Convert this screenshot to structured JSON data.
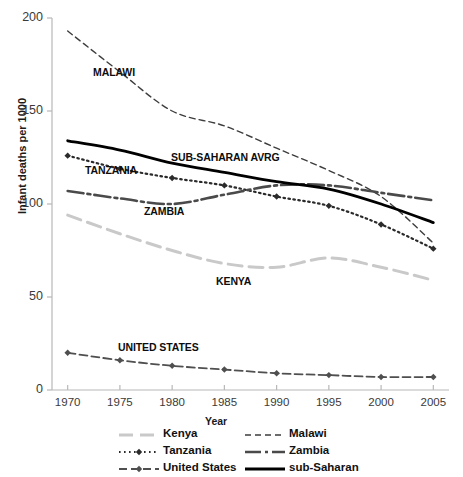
{
  "chart_data": {
    "type": "line",
    "title": "",
    "xlabel": "Year",
    "ylabel": "Infant deaths per 1000",
    "x": [
      1970,
      1975,
      1980,
      1985,
      1990,
      1995,
      2000,
      2005
    ],
    "xlim": [
      1968.5,
      2006.5
    ],
    "ylim": [
      0,
      200
    ],
    "yticks": [
      0,
      50,
      100,
      150,
      200
    ],
    "xticks": [
      "1970",
      "1975",
      "1980",
      "1985",
      "1990",
      "1995",
      "2000",
      "2005"
    ],
    "grid": false,
    "legend_position": "bottom",
    "series": [
      {
        "name": "Kenya",
        "legend_label": "Kenya",
        "annotation": "KENYA",
        "color": "#c9c9c9",
        "dash": "14,7",
        "width": 3,
        "marker": "none",
        "values": [
          94,
          84,
          75,
          68,
          66,
          71,
          66,
          59
        ]
      },
      {
        "name": "Malawi",
        "legend_label": "Malawi",
        "annotation": "MALAWI",
        "color": "#3d3d3d",
        "dash": "6,4",
        "width": 1.4,
        "marker": "none",
        "values": [
          193,
          171,
          150,
          142,
          130,
          118,
          104,
          79
        ]
      },
      {
        "name": "Tanzania",
        "legend_label": "Tanzania",
        "annotation": "TANZANIA",
        "color": "#2b2b2b",
        "dash": "1.6,3.4",
        "width": 2.2,
        "marker": "diamond",
        "values": [
          126,
          119,
          114,
          110,
          104,
          99,
          89,
          76
        ]
      },
      {
        "name": "Zambia",
        "legend_label": "Zambia",
        "annotation": "ZAMBIA",
        "color": "#4a4a4a",
        "dash": "16,4,3,4",
        "width": 2.6,
        "marker": "none",
        "values": [
          107,
          103,
          100,
          105,
          110,
          110,
          106,
          102
        ]
      },
      {
        "name": "United States",
        "legend_label": "United States",
        "annotation": "UNITED STATES",
        "color": "#4f4f4f",
        "dash": "8,4",
        "width": 1.8,
        "marker": "diamond",
        "values": [
          20,
          16,
          13,
          11,
          9,
          8,
          7,
          7
        ]
      },
      {
        "name": "sub-Saharan",
        "legend_label": "sub-Saharan",
        "annotation": "SUB-SAHARAN AVRG",
        "color": "#000000",
        "dash": "none",
        "width": 2.8,
        "marker": "none",
        "values": [
          134,
          129,
          122,
          117,
          112,
          108,
          100,
          90
        ]
      }
    ]
  },
  "annotations": {
    "malawi": "MALAWI",
    "sub_saharan": "SUB-SAHARAN AVRG",
    "tanzania": "TANZANIA",
    "zambia": "ZAMBIA",
    "kenya": "KENYA",
    "united_states": "UNITED STATES"
  },
  "axes": {
    "y_label": "Infant deaths per 1000",
    "x_label": "Year",
    "y_ticks": [
      "200",
      "150",
      "100",
      "50",
      "0"
    ],
    "x_ticks": [
      "1970",
      "1975",
      "1980",
      "1985",
      "1990",
      "1995",
      "2000",
      "2005"
    ]
  },
  "legend": {
    "items": [
      {
        "label": "Kenya",
        "series": "Kenya"
      },
      {
        "label": "Malawi",
        "series": "Malawi"
      },
      {
        "label": "Tanzania",
        "series": "Tanzania"
      },
      {
        "label": "Zambia",
        "series": "Zambia"
      },
      {
        "label": "United States",
        "series": "United States"
      },
      {
        "label": "sub-Saharan",
        "series": "sub-Saharan"
      }
    ]
  },
  "colors": {
    "axis": "#b8b8b8",
    "text": "#1a1a1a",
    "tick_text": "#3a3a3a",
    "background": "#ffffff"
  }
}
